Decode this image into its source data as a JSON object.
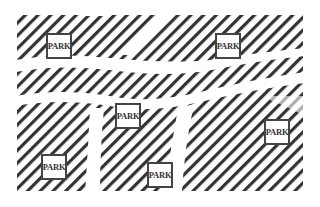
{
  "diagram": {
    "type": "city-map",
    "block_color": "#333333",
    "road_color": "#ffffff",
    "parks": [
      {
        "label": "PARK",
        "x": 46,
        "y": 33
      },
      {
        "label": "PARK",
        "x": 215,
        "y": 33
      },
      {
        "label": "PARK",
        "x": 115,
        "y": 103
      },
      {
        "label": "PARK",
        "x": 264,
        "y": 119
      },
      {
        "label": "PARK",
        "x": 41,
        "y": 154
      },
      {
        "label": "PARK",
        "x": 147,
        "y": 162
      }
    ]
  }
}
